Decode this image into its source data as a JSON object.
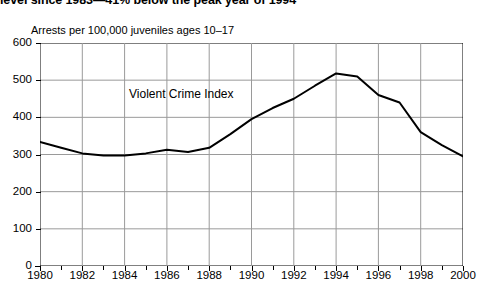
{
  "headline": {
    "text": "level since 1983—41% below the peak year of 1994"
  },
  "chart_data": {
    "type": "line",
    "title": "level since 1983—41% below the peak year of 1994",
    "subtitle": "Arrests per 100,000 juveniles ages 10–17",
    "xlabel": "",
    "ylabel": "Arrests per 100,000 juveniles ages 10–17",
    "ylim": [
      0,
      600
    ],
    "xlim": [
      1980,
      2000
    ],
    "ytick_labels": [
      "600",
      "500",
      "400",
      "300",
      "200",
      "100",
      "0"
    ],
    "yticks": [
      600,
      500,
      400,
      300,
      200,
      100,
      0
    ],
    "xtick_labels": [
      "1980",
      "1982",
      "1984",
      "1986",
      "1988",
      "1990",
      "1992",
      "1994",
      "1996",
      "1998",
      "2000"
    ],
    "xticks": [
      1980,
      1982,
      1984,
      1986,
      1988,
      1990,
      1992,
      1994,
      1996,
      1998,
      2000
    ],
    "minor_xticks_every": 1,
    "grid": "both",
    "grid_color": "#9a9a9a",
    "legend": "none",
    "series": [
      {
        "name": "Violent Crime Index",
        "color": "#000000",
        "line_width": 2,
        "annotation": "Violent Crime Index",
        "x": [
          1980,
          1981,
          1982,
          1983,
          1984,
          1985,
          1986,
          1987,
          1988,
          1989,
          1990,
          1991,
          1992,
          1993,
          1994,
          1995,
          1996,
          1997,
          1998,
          1999,
          2000
        ],
        "values": [
          334,
          318,
          303,
          297,
          297,
          303,
          313,
          307,
          318,
          355,
          395,
          425,
          450,
          485,
          518,
          510,
          460,
          440,
          360,
          325,
          295
        ]
      }
    ]
  }
}
